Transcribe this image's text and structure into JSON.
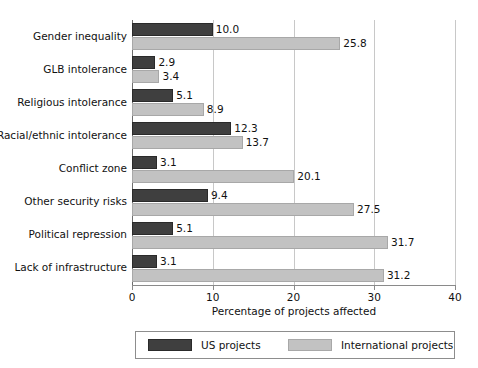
{
  "chart_data": {
    "type": "bar",
    "orientation": "horizontal",
    "title": "",
    "xlabel": "Percentage of projects affected",
    "ylabel": "",
    "xlim": [
      0,
      40
    ],
    "xticks": [
      0,
      10,
      20,
      30,
      40
    ],
    "xtick_labels": [
      "0",
      "10",
      "20",
      "30",
      "40"
    ],
    "grid": true,
    "grid_axis": "x",
    "legend_position": "bottom",
    "categories": [
      "Gender inequality",
      "GLB intolerance",
      "Religious intolerance",
      "Racial/ethnic intolerance",
      "Conflict zone",
      "Other security risks",
      "Political repression",
      "Lack of infrastructure"
    ],
    "series": [
      {
        "name": "US projects",
        "color": "#3f3f3f",
        "values": [
          10.0,
          2.9,
          5.1,
          12.3,
          3.1,
          9.4,
          5.1,
          3.1
        ],
        "labels": [
          "10.0",
          "2.9",
          "5.1",
          "12.3",
          "3.1",
          "9.4",
          "5.1",
          "3.1"
        ]
      },
      {
        "name": "International projects",
        "color": "#c2c2c2",
        "values": [
          25.8,
          3.4,
          8.9,
          13.7,
          20.1,
          27.5,
          31.7,
          31.2
        ],
        "labels": [
          "25.8",
          "3.4",
          "8.9",
          "13.7",
          "20.1",
          "27.5",
          "31.7",
          "31.2"
        ]
      }
    ]
  },
  "legend": {
    "entries": [
      {
        "label": "US projects",
        "swatch": "us"
      },
      {
        "label": "International projects",
        "swatch": "intl"
      }
    ]
  },
  "colors": {
    "us_projects": "#3f3f3f",
    "international_projects": "#c2c2c2",
    "gridline": "#c8c8c8",
    "axis": "#8a8a8a",
    "text": "#111111",
    "background": "#ffffff"
  }
}
